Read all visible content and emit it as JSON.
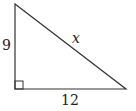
{
  "diagram": {
    "type": "right-triangle",
    "legs": {
      "vertical": {
        "label": "9",
        "value": 9
      },
      "horizontal": {
        "label": "12",
        "value": 12
      }
    },
    "hypotenuse": {
      "label": "x"
    },
    "right_angle_marker": true,
    "stroke_color": "#333333"
  }
}
